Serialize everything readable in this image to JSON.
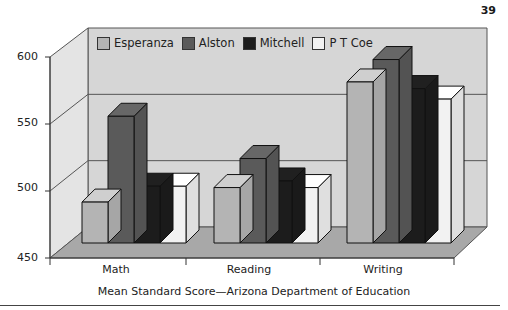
{
  "page": {
    "number": "39"
  },
  "chart_data": {
    "type": "bar",
    "title": "",
    "caption": "Mean Standard Score—Arizona Department of Education",
    "xlabel": "",
    "ylabel": "",
    "categories": [
      "Math",
      "Reading",
      "Writing"
    ],
    "series": [
      {
        "name": "Esperanza",
        "color": "#b4b4b4",
        "values": [
          481,
          492,
          572
        ]
      },
      {
        "name": "Alston",
        "color": "#5a5a5a",
        "values": [
          546,
          514,
          589
        ]
      },
      {
        "name": "Mitchell",
        "color": "#1c1c1c",
        "values": [
          493,
          497,
          567
        ]
      },
      {
        "name": "P T Coe",
        "color": "#f2f2f2",
        "values": [
          493,
          492,
          559
        ]
      }
    ],
    "yticks": [
      "600",
      "550",
      "500",
      "450"
    ],
    "ylim": [
      450,
      600
    ],
    "grid": true,
    "legend_position": "top-inside",
    "style": "3d-clustered-column"
  }
}
